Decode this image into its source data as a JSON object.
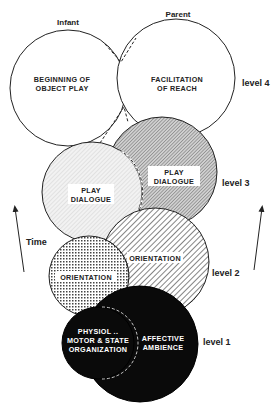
{
  "diagram": {
    "colors": {
      "stroke": "#222222",
      "background": "#ffffff",
      "level3_left_fill": "#ececec",
      "level3_right_fill": "#b8b8b8",
      "level1_fill": "#0a0a0a",
      "label_box": "#ffffff"
    },
    "top_labels": {
      "infant": "Infant",
      "parent": "Parent"
    },
    "side_labels": {
      "time": "Time",
      "level4": "level 4",
      "level3": "level 3",
      "level2": "level 2",
      "level1": "level 1"
    },
    "levels": [
      {
        "level": "level 4",
        "infant_circle": {
          "line1": "BEGINNING  OF",
          "line2": "OBJECT  PLAY",
          "pattern": "none"
        },
        "parent_circle": {
          "line1": "FACILITATION",
          "line2": "OF  REACH",
          "pattern": "none"
        }
      },
      {
        "level": "level 3",
        "infant_circle": {
          "line1": "PLAY",
          "line2": "DIALOGUE",
          "pattern": "light-stipple"
        },
        "parent_circle": {
          "line1": "PLAY",
          "line2": "DIALOGUE",
          "pattern": "dense-diagonal-hatch"
        }
      },
      {
        "level": "level 2",
        "infant_circle": {
          "line1": "ORIENTATION",
          "pattern": "crosshatch-dots"
        },
        "parent_circle": {
          "line1": "ORIENTATION",
          "pattern": "diagonal-hatch"
        }
      },
      {
        "level": "level 1",
        "infant_circle": {
          "line1": "PHYSIOL ..",
          "line2": "MOTOR & STATE",
          "line3": "ORGANIZATION",
          "pattern": "solid-black"
        },
        "parent_circle": {
          "line1": "AFFECTIVE",
          "line2": "AMBIENCE",
          "pattern": "solid-black"
        }
      }
    ],
    "arrows": [
      {
        "name": "left-time-arrow",
        "direction": "up"
      },
      {
        "name": "right-time-arrow",
        "direction": "up"
      }
    ]
  }
}
